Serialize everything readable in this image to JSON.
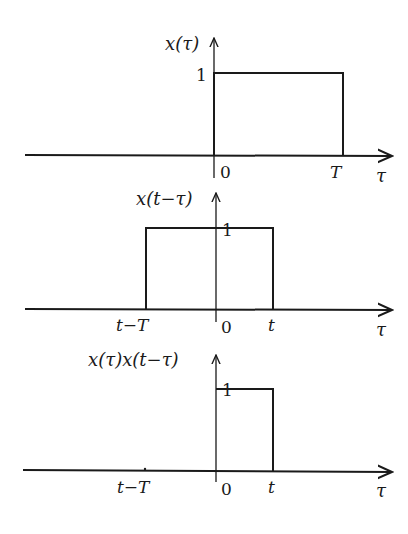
{
  "diagram": {
    "panels": [
      {
        "id": "x-tau",
        "ylabel": "x(τ)",
        "height_label": "1",
        "xlabel": "τ",
        "ticks": [
          {
            "label": "0",
            "pos": 0
          },
          {
            "label": "T",
            "pos": "T"
          }
        ],
        "pulse": {
          "from": "0",
          "to": "T",
          "height": 1
        }
      },
      {
        "id": "x-t-minus-tau",
        "ylabel": "x(t−τ)",
        "height_label": "1",
        "xlabel": "τ",
        "ticks": [
          {
            "label": "t−T",
            "pos": "t-T"
          },
          {
            "label": "0",
            "pos": 0
          },
          {
            "label": "t",
            "pos": "t"
          }
        ],
        "pulse": {
          "from": "t−T",
          "to": "t",
          "height": 1
        }
      },
      {
        "id": "product",
        "ylabel": "x(τ)x(t−τ)",
        "height_label": "1",
        "xlabel": "τ",
        "ticks": [
          {
            "label": "t−T",
            "pos": "t-T"
          },
          {
            "label": "0",
            "pos": 0
          },
          {
            "label": "t",
            "pos": "t"
          }
        ],
        "pulse": {
          "from": "0",
          "to": "t",
          "height": 1
        }
      }
    ]
  }
}
